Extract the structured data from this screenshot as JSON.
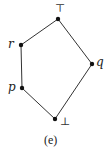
{
  "diagram": {
    "type": "hasse-diagram",
    "caption": "(e)",
    "nodes": [
      {
        "id": "top",
        "label": "⊤",
        "x": 58,
        "y": 19
      },
      {
        "id": "r",
        "label": "r",
        "x": 21,
        "y": 45
      },
      {
        "id": "q",
        "label": "q",
        "x": 92,
        "y": 64
      },
      {
        "id": "p",
        "label": "p",
        "x": 22,
        "y": 88
      },
      {
        "id": "bottom",
        "label": "⊥",
        "x": 55,
        "y": 119
      }
    ],
    "edges": [
      [
        "top",
        "r"
      ],
      [
        "top",
        "q"
      ],
      [
        "r",
        "p"
      ],
      [
        "p",
        "bottom"
      ],
      [
        "q",
        "bottom"
      ]
    ],
    "colors": {
      "line": "#333333",
      "node": "#111111"
    }
  }
}
